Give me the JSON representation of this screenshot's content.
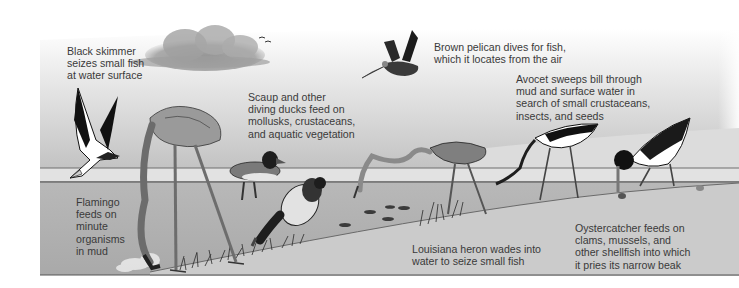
{
  "figure": {
    "labels": {
      "black_skimmer": "Black skimmer\nseizes small fish\nat water surface",
      "scaup": "Scaup and other\ndiving ducks feed on\nmollusks, crustaceans,\nand aquatic vegetation",
      "brown_pelican": "Brown pelican dives for fish,\nwhich it locates from the air",
      "avocet": "Avocet sweeps bill through\nmud and surface water in\nsearch of small crustaceans,\ninsects, and seeds",
      "flamingo": "Flamingo\nfeeds on\nminute\norganisms\nin mud",
      "louisiana_heron": "Louisiana heron wades into\nwater to seize small fish",
      "oystercatcher": "Oystercatcher feeds on\nclams, mussels, and\nother shellfish into which\nit pries its narrow beak"
    },
    "birds": [
      "Black skimmer",
      "Flamingo",
      "Scaup",
      "Brown pelican",
      "Louisiana heron",
      "Avocet",
      "Oystercatcher"
    ],
    "colors": {
      "sky_top": "#ffffff",
      "sky_mid": "#d6d6d6",
      "water_surface": "#e4e4e4",
      "water": "#b4b4b4",
      "mud": "#cfcfcf",
      "ink": "#1c1c1c",
      "text": "#3a3a3a"
    }
  }
}
